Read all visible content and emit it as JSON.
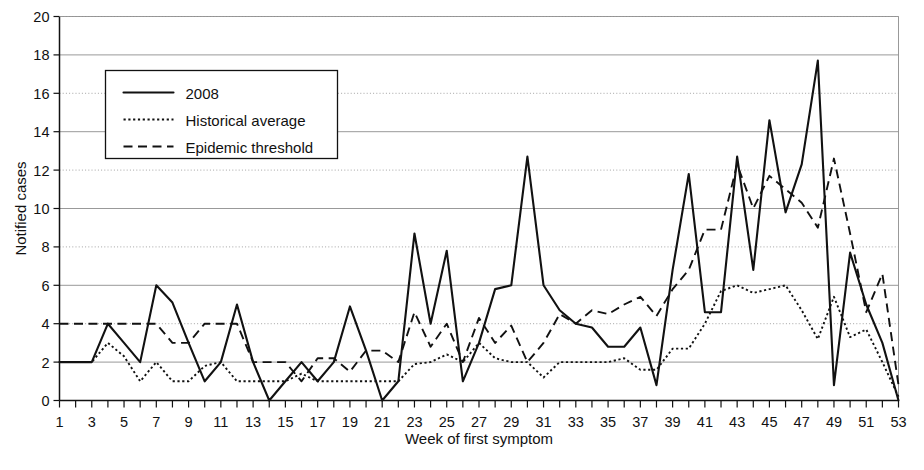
{
  "chart_data": {
    "type": "line",
    "title": "",
    "xlabel": "Week of first symptom",
    "ylabel": "Notified cases",
    "xlim": [
      1,
      53
    ],
    "ylim": [
      0,
      20
    ],
    "ytick_step": 2,
    "xtick_step_labeled": 2,
    "grid": "horizontal",
    "legend_position": "top-left-inside",
    "x": [
      1,
      2,
      3,
      4,
      5,
      6,
      7,
      8,
      9,
      10,
      11,
      12,
      13,
      14,
      15,
      16,
      17,
      18,
      19,
      20,
      21,
      22,
      23,
      24,
      25,
      26,
      27,
      28,
      29,
      30,
      31,
      32,
      33,
      34,
      35,
      36,
      37,
      38,
      39,
      40,
      41,
      42,
      43,
      44,
      45,
      46,
      47,
      48,
      49,
      50,
      51,
      52,
      53
    ],
    "yticks": [
      0,
      2,
      4,
      6,
      8,
      10,
      12,
      14,
      16,
      18,
      20
    ],
    "xticks_labeled": [
      1,
      3,
      5,
      7,
      9,
      11,
      13,
      15,
      17,
      19,
      21,
      23,
      25,
      27,
      29,
      31,
      33,
      35,
      37,
      39,
      41,
      43,
      45,
      47,
      49,
      51,
      53
    ],
    "series": [
      {
        "name": "2008",
        "style": "solid",
        "color": "#111111",
        "values": [
          2.0,
          2.0,
          2.0,
          4.0,
          3.0,
          2.0,
          6.0,
          5.1,
          3.0,
          1.0,
          2.0,
          5.0,
          2.0,
          0.0,
          1.0,
          2.0,
          1.0,
          2.0,
          4.9,
          2.6,
          0.0,
          1.0,
          8.7,
          4.0,
          7.8,
          1.0,
          3.0,
          5.8,
          6.0,
          12.7,
          6.0,
          4.7,
          4.0,
          3.8,
          2.8,
          2.8,
          3.8,
          0.8,
          6.8,
          11.8,
          4.6,
          4.6,
          12.7,
          6.8,
          14.6,
          9.8,
          12.3,
          17.7,
          0.8,
          7.7,
          5.0,
          3.0,
          0.0
        ]
      },
      {
        "name": "Historical average",
        "style": "dotted",
        "color": "#111111",
        "values": [
          2.0,
          2.0,
          2.0,
          3.0,
          2.3,
          1.0,
          2.0,
          1.0,
          1.0,
          1.8,
          2.0,
          1.0,
          1.0,
          1.0,
          1.0,
          1.4,
          1.0,
          1.0,
          1.0,
          1.0,
          1.0,
          1.0,
          1.9,
          2.0,
          2.4,
          2.0,
          3.0,
          2.2,
          2.0,
          2.0,
          1.2,
          2.0,
          2.0,
          2.0,
          2.0,
          2.2,
          1.6,
          1.6,
          2.7,
          2.7,
          4.0,
          5.7,
          6.0,
          5.6,
          5.8,
          6.0,
          4.7,
          3.2,
          5.4,
          3.3,
          3.7,
          2.0,
          0.2
        ]
      },
      {
        "name": "Epidemic threshold",
        "style": "dashed",
        "color": "#111111",
        "values": [
          4.0,
          4.0,
          4.0,
          4.0,
          4.0,
          4.0,
          4.0,
          3.0,
          3.0,
          4.0,
          4.0,
          4.0,
          2.0,
          2.0,
          2.0,
          1.0,
          2.2,
          2.2,
          1.5,
          2.6,
          2.6,
          2.0,
          4.6,
          2.8,
          4.0,
          2.0,
          4.3,
          3.0,
          3.9,
          2.0,
          3.0,
          4.5,
          4.0,
          4.7,
          4.5,
          5.0,
          5.4,
          4.4,
          5.8,
          6.8,
          8.9,
          8.9,
          12.3,
          10.0,
          11.7,
          11.0,
          10.3,
          9.0,
          12.6,
          8.7,
          4.6,
          6.6,
          0.8
        ]
      }
    ],
    "legend": [
      {
        "label": "2008",
        "style": "solid"
      },
      {
        "label": "Historical average",
        "style": "dotted"
      },
      {
        "label": "Epidemic threshold",
        "style": "dashed"
      }
    ]
  }
}
